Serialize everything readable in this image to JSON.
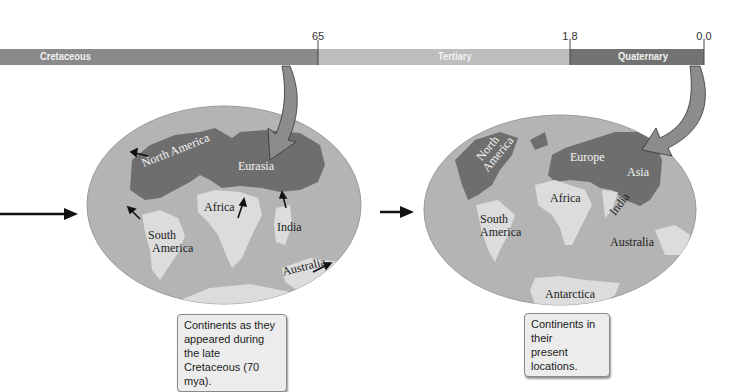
{
  "timeline": {
    "ticks": [
      {
        "label": "65",
        "x": 318
      },
      {
        "label": "1.8",
        "x": 570
      },
      {
        "label": "0.0",
        "x": 704
      }
    ],
    "periods": [
      {
        "name": "Cretaceous",
        "x_start": 0,
        "x_end": 318,
        "color": "#8a8a8a"
      },
      {
        "name": "Tertiary",
        "x_start": 318,
        "x_end": 570,
        "color": "#bdbdbd"
      },
      {
        "name": "Quaternary",
        "x_start": 570,
        "x_end": 704,
        "color": "#727272"
      }
    ]
  },
  "maps": {
    "cretaceous": {
      "labels": {
        "north_america": "North America",
        "eurasia": "Eurasia",
        "africa": "Africa",
        "south_america_1": "South",
        "south_america_2": "America",
        "india": "India",
        "australia": "Australia"
      },
      "caption": [
        "Continents as they",
        "appeared during the late",
        "Cretaceous (70 mya)."
      ]
    },
    "present": {
      "labels": {
        "north_america_1": "North",
        "north_america_2": "America",
        "europe": "Europe",
        "asia": "Asia",
        "africa": "Africa",
        "india": "India",
        "south_america_1": "South",
        "south_america_2": "America",
        "australia": "Australia",
        "antarctica": "Antarctica"
      },
      "caption": [
        "Continents in their",
        "present locations."
      ]
    }
  },
  "colors": {
    "ocean": "#b4b4b4",
    "dark_land": "#6e6e6e",
    "light_land": "#dcdcdc",
    "arrow_fill": "#8c8c8c"
  }
}
